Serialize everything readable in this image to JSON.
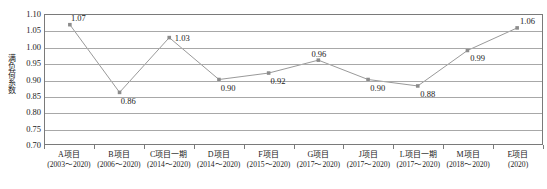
{
  "chart_data": {
    "type": "line",
    "title": "",
    "xlabel": "",
    "ylabel": "满负荷系数",
    "ylim": [
      0.7,
      1.1
    ],
    "ytick_step": 0.05,
    "yticks": [
      "1.10",
      "1.05",
      "1.00",
      "0.95",
      "0.90",
      "0.85",
      "0.80",
      "0.75",
      "0.70"
    ],
    "grid": "horizontal",
    "legend": "none",
    "line_color": "#8c8c8c",
    "marker": "square",
    "marker_color": "#8c8c8c",
    "categories": [
      "A项目",
      "B项目",
      "C项目一期",
      "D项目",
      "F项目",
      "G项目",
      "J项目",
      "L项目一期",
      "M项目",
      "E项目"
    ],
    "category_years": [
      "(2003～2020)",
      "(2006～2020)",
      "(2014～2020)",
      "(2014～2020)",
      "(2015～2020)",
      "(2017～2020)",
      "(2017～2020)",
      "(2017～2020)",
      "(2018～2020)",
      "(2020)"
    ],
    "values": [
      1.07,
      0.86,
      1.03,
      0.9,
      0.92,
      0.96,
      0.9,
      0.88,
      0.99,
      1.06
    ],
    "data_labels": [
      "1.07",
      "0.86",
      "1.03",
      "0.90",
      "0.92",
      "0.96",
      "0.90",
      "0.88",
      "0.99",
      "1.06"
    ],
    "label_positions": [
      "above-right",
      "below-right",
      "right",
      "below-right",
      "below-right",
      "above",
      "below-right",
      "below-right",
      "below-right",
      "above-right"
    ]
  }
}
